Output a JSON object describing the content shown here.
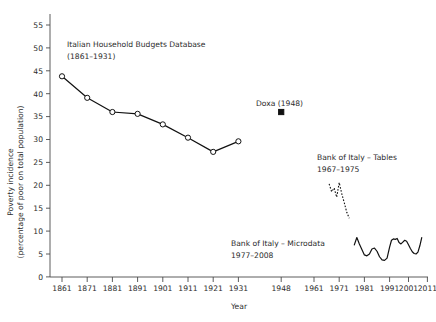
{
  "chart_data": {
    "type": "line",
    "title": "",
    "xlabel": "Year",
    "ylabel": "Poverty incidence (percentage of poor on total population)",
    "ylabel_line1": "Poverty incidence",
    "ylabel_line2": "(percentage of poor on total population)",
    "ylim": [
      0,
      57
    ],
    "yticks": [
      0,
      5,
      10,
      15,
      20,
      25,
      30,
      35,
      40,
      45,
      50,
      55
    ],
    "xticks": [
      1861,
      1871,
      1881,
      1891,
      1901,
      1911,
      1921,
      1931,
      1948,
      1961,
      1971,
      1981,
      1991,
      2001,
      2011
    ],
    "xtick_labels": [
      "1861",
      "1871",
      "1881",
      "1891",
      "1901",
      "1911",
      "1921",
      "1931",
      "1948",
      "1961",
      "1971",
      "1981",
      "1991",
      "2001",
      "2011"
    ],
    "grid": false,
    "legend_position": "inline-annotations",
    "series": [
      {
        "name": "Italian Household Budgets Database",
        "period": "1861-1931",
        "style": "solid-with-open-circle-markers",
        "x": [
          1861,
          1871,
          1881,
          1891,
          1901,
          1911,
          1921,
          1931
        ],
        "values": [
          43.8,
          39.1,
          36.0,
          35.6,
          33.3,
          30.4,
          27.3,
          29.6
        ]
      },
      {
        "name": "Doxa",
        "period": "1948",
        "style": "filled-square-marker",
        "x": [
          1948
        ],
        "values": [
          36.0
        ]
      },
      {
        "name": "Bank of Italy - Tables",
        "period": "1967-1975",
        "style": "dashed",
        "x": [
          1967,
          1968,
          1969,
          1970,
          1971,
          1972,
          1973,
          1974,
          1975
        ],
        "values": [
          20.3,
          18.6,
          19.4,
          17.4,
          20.6,
          18.2,
          16.2,
          14.1,
          12.8
        ]
      },
      {
        "name": "Bank of Italy - Microdata",
        "period": "1977-2008",
        "style": "solid",
        "x": [
          1977,
          1978,
          1979,
          1980,
          1981,
          1982,
          1983,
          1984,
          1985,
          1986,
          1987,
          1988,
          1989,
          1990,
          1991,
          1992,
          1993,
          1994,
          1995,
          1996,
          1997,
          1998,
          1999,
          2000,
          2001,
          2002,
          2003,
          2004,
          2005,
          2006,
          2007,
          2008
        ],
        "values": [
          7.0,
          8.6,
          7.2,
          6.0,
          4.8,
          4.6,
          5.0,
          6.1,
          6.3,
          5.6,
          4.4,
          3.7,
          3.6,
          4.1,
          6.5,
          8.0,
          8.3,
          8.2,
          8.4,
          7.5,
          7.2,
          7.6,
          8.0,
          7.8,
          7.0,
          6.2,
          5.5,
          5.1,
          5.0,
          5.4,
          6.8,
          8.6
        ]
      }
    ],
    "annotations": [
      {
        "id": "ann-ihbd",
        "line1": "Italian Household Budgets Database",
        "line2": "(1861–1931)"
      },
      {
        "id": "ann-doxa",
        "line1": "Doxa (1948)",
        "line2": ""
      },
      {
        "id": "ann-boi-tables",
        "line1": "Bank of Italy – Tables",
        "line2": "1967–1975"
      },
      {
        "id": "ann-boi-micro",
        "line1": "Bank of Italy – Microdata",
        "line2": "1977–2008"
      }
    ],
    "colors": {
      "line": "#111111",
      "axis": "#4a4a4a",
      "text": "#2b2b2b",
      "background": "#ffffff"
    }
  }
}
